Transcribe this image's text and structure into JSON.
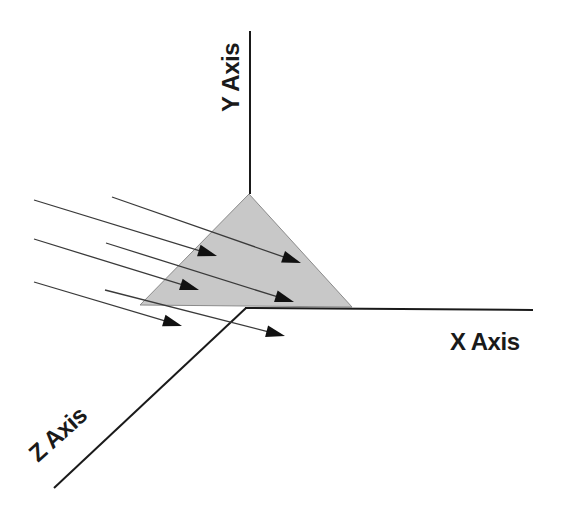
{
  "diagram": {
    "title": "",
    "colors": {
      "background": "#ffffff",
      "axis": "#1a1a1a",
      "ray": "#3a3a3a",
      "arrowhead": "#111111",
      "plane_fill": "#c8c8c8",
      "plane_stroke": "#8a8a8a"
    },
    "axes": {
      "y": {
        "label": "Y Axis",
        "from": [
          250,
          31
        ],
        "to": [
          250,
          194
        ]
      },
      "x": {
        "label": "X Axis",
        "from": [
          245,
          308
        ],
        "to": [
          533,
          310
        ]
      },
      "z": {
        "label": "Z Axis",
        "from": [
          246,
          308
        ],
        "to": [
          54,
          488
        ]
      }
    },
    "plane": {
      "shape": "triangle",
      "vertices": [
        [
          249,
          194
        ],
        [
          140,
          305
        ],
        [
          352,
          307
        ]
      ]
    },
    "rays": [
      {
        "id": "ray-1",
        "from": [
          112,
          197
        ],
        "to": [
          301,
          263
        ]
      },
      {
        "id": "ray-2",
        "from": [
          34,
          200
        ],
        "to": [
          217,
          256
        ]
      },
      {
        "id": "ray-3",
        "from": [
          106,
          243
        ],
        "to": [
          294,
          302
        ]
      },
      {
        "id": "ray-4",
        "from": [
          34,
          239
        ],
        "to": [
          199,
          290
        ]
      },
      {
        "id": "ray-5",
        "from": [
          105,
          290
        ],
        "to": [
          285,
          336
        ]
      },
      {
        "id": "ray-6",
        "from": [
          34,
          282
        ],
        "to": [
          182,
          326
        ]
      }
    ]
  }
}
